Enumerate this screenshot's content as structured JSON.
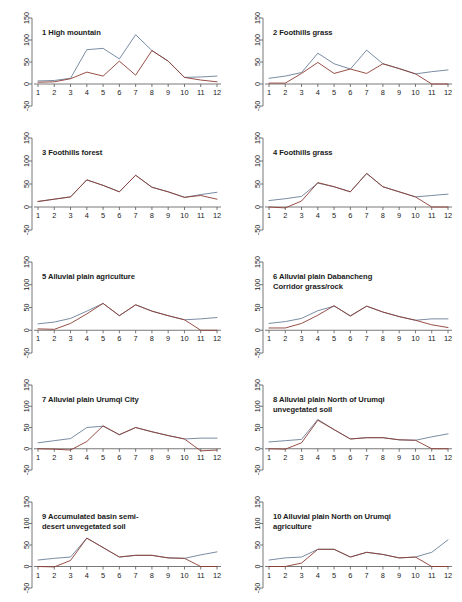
{
  "figure": {
    "type": "small-multiples-line-chart-grid",
    "rows": 5,
    "cols": 2,
    "background": "#ffffff"
  },
  "axes": {
    "x_ticks": [
      "1",
      "2",
      "3",
      "4",
      "5",
      "6",
      "7",
      "8",
      "9",
      "10",
      "11",
      "12"
    ],
    "y_ticks": [
      "-50",
      "0",
      "50",
      "100",
      "150"
    ],
    "ylim": [
      -50,
      150
    ],
    "xlim": [
      1,
      12
    ],
    "xlabel": "",
    "ylabel": ""
  },
  "colors": {
    "series_1": "#6b7f99",
    "series_2": "#8c3b32",
    "axis": "#555555",
    "text": "#1a1a1a"
  },
  "chart_data": [
    {
      "type": "line",
      "index": "1",
      "title": "1 High mountain",
      "x": [
        1,
        2,
        3,
        4,
        5,
        6,
        7,
        8,
        9,
        10,
        11,
        12
      ],
      "xlabel": "",
      "ylabel": "",
      "ylim": [
        -50,
        150
      ],
      "grid": false,
      "legend": "none",
      "series": [
        {
          "name": "series_1",
          "color": "#6b7f99",
          "values": [
            7,
            8,
            13,
            78,
            81,
            57,
            112,
            76,
            52,
            15,
            16,
            18
          ]
        },
        {
          "name": "series_2",
          "color": "#8c3b32",
          "values": [
            4,
            5,
            12,
            27,
            18,
            52,
            20,
            76,
            52,
            15,
            9,
            5
          ]
        }
      ]
    },
    {
      "type": "line",
      "index": "2",
      "title": "2 Foothills grass",
      "x": [
        1,
        2,
        3,
        4,
        5,
        6,
        7,
        8,
        9,
        10,
        11,
        12
      ],
      "xlabel": "",
      "ylabel": "",
      "ylim": [
        -50,
        150
      ],
      "grid": false,
      "legend": "none",
      "series": [
        {
          "name": "series_1",
          "color": "#6b7f99",
          "values": [
            13,
            18,
            26,
            70,
            46,
            34,
            77,
            46,
            35,
            23,
            28,
            32
          ]
        },
        {
          "name": "series_2",
          "color": "#8c3b32",
          "values": [
            2,
            2,
            24,
            49,
            24,
            34,
            24,
            46,
            35,
            23,
            0,
            0
          ]
        }
      ]
    },
    {
      "type": "line",
      "index": "3",
      "title": "3 Foothills forest",
      "x": [
        1,
        2,
        3,
        4,
        5,
        6,
        7,
        8,
        9,
        10,
        11,
        12
      ],
      "xlabel": "",
      "ylabel": "",
      "ylim": [
        -50,
        150
      ],
      "grid": false,
      "legend": "none",
      "series": [
        {
          "name": "series_1",
          "color": "#6b7f99",
          "values": [
            12,
            17,
            22,
            59,
            47,
            33,
            69,
            43,
            33,
            21,
            27,
            32
          ]
        },
        {
          "name": "series_2",
          "color": "#8c3b32",
          "values": [
            12,
            17,
            22,
            59,
            47,
            33,
            69,
            43,
            33,
            21,
            25,
            17
          ]
        }
      ]
    },
    {
      "type": "line",
      "index": "4",
      "title": "4 Foothills grass",
      "x": [
        1,
        2,
        3,
        4,
        5,
        6,
        7,
        8,
        9,
        10,
        11,
        12
      ],
      "xlabel": "",
      "ylabel": "",
      "ylim": [
        -50,
        150
      ],
      "grid": false,
      "legend": "none",
      "series": [
        {
          "name": "series_1",
          "color": "#6b7f99",
          "values": [
            14,
            18,
            23,
            52,
            44,
            33,
            73,
            44,
            33,
            22,
            25,
            28
          ]
        },
        {
          "name": "series_2",
          "color": "#8c3b32",
          "values": [
            0,
            -2,
            13,
            53,
            44,
            33,
            73,
            44,
            33,
            22,
            0,
            0
          ]
        }
      ]
    },
    {
      "type": "line",
      "index": "5",
      "title": "5 Alluvial plain agriculture",
      "x": [
        1,
        2,
        3,
        4,
        5,
        6,
        7,
        8,
        9,
        10,
        11,
        12
      ],
      "xlabel": "",
      "ylabel": "",
      "ylim": [
        -50,
        150
      ],
      "grid": false,
      "legend": "none",
      "series": [
        {
          "name": "series_1",
          "color": "#6b7f99",
          "values": [
            14,
            18,
            26,
            42,
            59,
            32,
            56,
            42,
            32,
            23,
            25,
            28
          ]
        },
        {
          "name": "series_2",
          "color": "#8c3b32",
          "values": [
            3,
            2,
            15,
            36,
            59,
            32,
            56,
            42,
            32,
            23,
            0,
            0
          ]
        }
      ]
    },
    {
      "type": "line",
      "index": "6",
      "title": "6 Alluvial plain Dabancheng\n Corridor grass/rock",
      "x": [
        1,
        2,
        3,
        4,
        5,
        6,
        7,
        8,
        9,
        10,
        11,
        12
      ],
      "xlabel": "",
      "ylabel": "",
      "ylim": [
        -50,
        150
      ],
      "grid": false,
      "legend": "none",
      "series": [
        {
          "name": "series_1",
          "color": "#6b7f99",
          "values": [
            15,
            19,
            26,
            43,
            53,
            32,
            53,
            40,
            30,
            22,
            25,
            25
          ]
        },
        {
          "name": "series_2",
          "color": "#8c3b32",
          "values": [
            5,
            5,
            15,
            33,
            54,
            31,
            53,
            40,
            30,
            22,
            12,
            6
          ]
        }
      ]
    },
    {
      "type": "line",
      "index": "7",
      "title": "7 Alluvial plain Urumqi City",
      "x": [
        1,
        2,
        3,
        4,
        5,
        6,
        7,
        8,
        9,
        10,
        11,
        12
      ],
      "xlabel": "",
      "ylabel": "",
      "ylim": [
        -50,
        150
      ],
      "grid": false,
      "legend": "none",
      "series": [
        {
          "name": "series_1",
          "color": "#6b7f99",
          "values": [
            14,
            19,
            24,
            50,
            53,
            33,
            50,
            40,
            31,
            23,
            25,
            25
          ]
        },
        {
          "name": "series_2",
          "color": "#8c3b32",
          "values": [
            0,
            -1,
            -3,
            17,
            54,
            33,
            50,
            40,
            31,
            23,
            -5,
            -3
          ]
        }
      ]
    },
    {
      "type": "line",
      "index": "8",
      "title": "8 Alluvial plain North of Urumqi\n unvegetated soil",
      "x": [
        1,
        2,
        3,
        4,
        5,
        6,
        7,
        8,
        9,
        10,
        11,
        12
      ],
      "xlabel": "",
      "ylabel": "",
      "ylim": [
        -50,
        150
      ],
      "grid": false,
      "legend": "none",
      "series": [
        {
          "name": "series_1",
          "color": "#6b7f99",
          "values": [
            16,
            19,
            22,
            69,
            45,
            23,
            26,
            26,
            21,
            20,
            28,
            35
          ]
        },
        {
          "name": "series_2",
          "color": "#8c3b32",
          "values": [
            0,
            -1,
            14,
            67,
            45,
            23,
            26,
            26,
            21,
            20,
            0,
            0
          ]
        }
      ]
    },
    {
      "type": "line",
      "index": "9",
      "title": "9 Accumulated basin semi-\n desert unvegetated soil",
      "x": [
        1,
        2,
        3,
        4,
        5,
        6,
        7,
        8,
        9,
        10,
        11,
        12
      ],
      "xlabel": "",
      "ylabel": "",
      "ylim": [
        -50,
        150
      ],
      "grid": false,
      "legend": "none",
      "series": [
        {
          "name": "series_1",
          "color": "#6b7f99",
          "values": [
            15,
            19,
            22,
            66,
            44,
            22,
            26,
            26,
            20,
            19,
            27,
            34
          ]
        },
        {
          "name": "series_2",
          "color": "#8c3b32",
          "values": [
            0,
            -1,
            14,
            66,
            44,
            22,
            26,
            26,
            20,
            19,
            0,
            0
          ]
        }
      ]
    },
    {
      "type": "line",
      "index": "10",
      "title": "10 Alluvial plain North on Urumqi\n agriculture",
      "x": [
        1,
        2,
        3,
        4,
        5,
        6,
        7,
        8,
        9,
        10,
        11,
        12
      ],
      "xlabel": "",
      "ylabel": "",
      "ylim": [
        -50,
        150
      ],
      "grid": false,
      "legend": "none",
      "series": [
        {
          "name": "series_1",
          "color": "#6b7f99",
          "values": [
            15,
            20,
            22,
            40,
            40,
            22,
            33,
            28,
            20,
            22,
            33,
            62
          ]
        },
        {
          "name": "series_2",
          "color": "#8c3b32",
          "values": [
            0,
            0,
            8,
            40,
            40,
            22,
            33,
            28,
            20,
            22,
            0,
            0
          ]
        }
      ]
    }
  ]
}
